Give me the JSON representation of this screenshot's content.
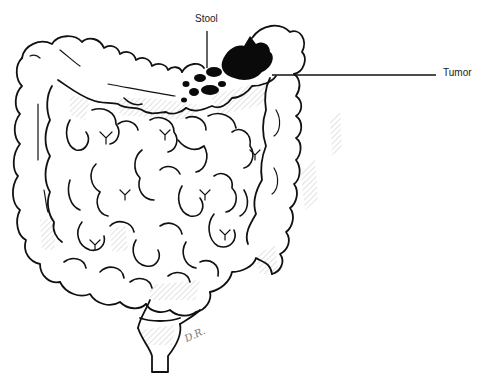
{
  "diagram": {
    "labels": {
      "stool": "Stool",
      "tumor": "Tumor"
    },
    "signature": "D.R.",
    "colors": {
      "ink": "#111111",
      "hatch": "#9a9a9a",
      "background": "#ffffff",
      "tumor": "#0a0a0a"
    }
  }
}
